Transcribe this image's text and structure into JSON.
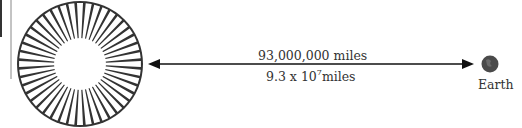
{
  "diagram": {
    "sun": {
      "icon": "sun-icon",
      "color": "#333333"
    },
    "earth": {
      "label": "Earth",
      "icon": "earth-icon",
      "color": "#555555"
    },
    "distance": {
      "standard": "93,000,000 miles",
      "scientific_coefficient": "9.3 x 10",
      "scientific_exponent": "7",
      "scientific_unit": "miles"
    },
    "arrow": {
      "type": "double-headed",
      "color": "#111111"
    }
  }
}
